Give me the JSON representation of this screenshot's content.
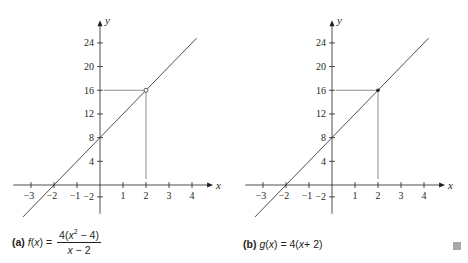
{
  "chart_data": [
    {
      "type": "line",
      "panel": "a",
      "caption_tag": "(a)",
      "caption_lhs": "f(x) =",
      "caption_numerator": "4(x² − 4)",
      "caption_denominator": "x − 2",
      "function": "f(x) = 4(x^2 - 4)/(x - 2)",
      "xlabel": "x",
      "ylabel": "y",
      "x_ticks": [
        -3,
        -2,
        -1,
        1,
        2,
        3,
        4
      ],
      "y_ticks": [
        -2,
        4,
        8,
        12,
        16,
        20,
        24
      ],
      "xlim": [
        -3.6,
        4.7
      ],
      "ylim": [
        -4.5,
        27
      ],
      "line_points": [
        [
          -3.35,
          -5.4
        ],
        [
          4.2,
          24.8
        ]
      ],
      "special_point": {
        "x": 2,
        "y": 16,
        "style": "open-circle"
      },
      "guide_lines": {
        "horizontal_at_y": 16,
        "vertical_at_x": 2
      },
      "grid": false
    },
    {
      "type": "line",
      "panel": "b",
      "caption_tag": "(b)",
      "caption_text": "g(x) = 4(x + 2)",
      "function": "g(x) = 4(x + 2)",
      "xlabel": "x",
      "ylabel": "y",
      "x_ticks": [
        -3,
        -2,
        -1,
        1,
        2,
        3,
        4
      ],
      "y_ticks": [
        -2,
        4,
        8,
        12,
        16,
        20,
        24
      ],
      "xlim": [
        -3.6,
        4.7
      ],
      "ylim": [
        -4.5,
        27
      ],
      "line_points": [
        [
          -3.35,
          -5.4
        ],
        [
          4.2,
          24.8
        ]
      ],
      "special_point": {
        "x": 2,
        "y": 16,
        "style": "filled-dot"
      },
      "guide_lines": {
        "horizontal_at_y": 16,
        "vertical_at_x": 2
      },
      "grid": false
    }
  ],
  "captions": {
    "a": {
      "tag": "(a)",
      "f": "f",
      "x": "x",
      "eq": "=",
      "num_pre": "4(",
      "num_x": "x",
      "num_sup": "2",
      "num_post": " − 4)",
      "den_x": "x",
      "den_post": " − 2"
    },
    "b": {
      "tag": "(b)",
      "g": "g",
      "x": "x",
      "eq": "= 4(",
      "x2": "x",
      "post": " + 2)"
    }
  },
  "colors": {
    "ink": "#231f20",
    "end_mark": "#a7a9ac"
  }
}
